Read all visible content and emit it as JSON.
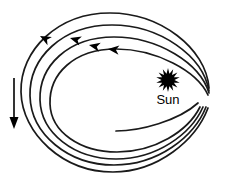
{
  "figure": {
    "kind": "spiral-orbit-diagram",
    "background_color": "#ffffff",
    "stroke_color": "#1a1a1a",
    "sun_color": "#000000",
    "arrow_color": "#000000",
    "width": 225,
    "height": 192
  },
  "labels": {
    "sun": "Sun"
  },
  "icons": {
    "sun": "sun-starburst-icon",
    "drift": "down-arrow-icon",
    "direction": "orbit-direction-arrowhead-icon"
  },
  "sun": {
    "center_x": 168,
    "center_y": 80,
    "outer_radius": 12,
    "inner_radius": 6.5,
    "points": 14
  },
  "drift_arrow": {
    "x": 14,
    "y_start": 78,
    "y_end": 129,
    "head_width": 9,
    "head_length": 12,
    "shaft_width": 1.6
  },
  "orbit_loops": [
    {
      "name": "loop-1-outermost",
      "path": "M 209 88 C 206 48 160 13 110 13 C 58 13 20 50 21 92 C 22 134 63 172 113 172 C 158 172 196 140 208 108",
      "stroke_width": 1.7
    },
    {
      "name": "loop-2",
      "path": "M 209 91 C 203 56 160 25 112 25 C 62 25 29 58 30 96 C 31 134 68 165 114 165 C 158 165 194 137 206 107",
      "stroke_width": 1.7
    },
    {
      "name": "loop-3",
      "path": "M 209 93 C 200 63 158 37 114 37 C 68 37 39 66 40 100 C 41 133 74 159 116 159 C 157 159 191 134 203 107",
      "stroke_width": 1.7
    },
    {
      "name": "loop-4-innermost",
      "path": "M 208 95 C 197 71 156 49 116 49 C 74 49 49 74 50 104 C 51 132 80 152 117 152 C 155 152 188 131 200 107",
      "stroke_width": 1.7
    },
    {
      "name": "loop-tail-inner-end",
      "path": "M 116 131 C 140 131 178 121 198 103",
      "stroke_width": 1.7
    }
  ],
  "direction_arrowheads": [
    {
      "name": "arrowhead-1",
      "x": 40,
      "y": 36,
      "angle": 208,
      "size": 11
    },
    {
      "name": "arrowhead-2",
      "x": 70,
      "y": 38,
      "angle": 196,
      "size": 11
    },
    {
      "name": "arrowhead-3",
      "x": 89,
      "y": 45,
      "angle": 192,
      "size": 11
    },
    {
      "name": "arrowhead-4",
      "x": 108,
      "y": 49,
      "angle": 186,
      "size": 11
    }
  ]
}
